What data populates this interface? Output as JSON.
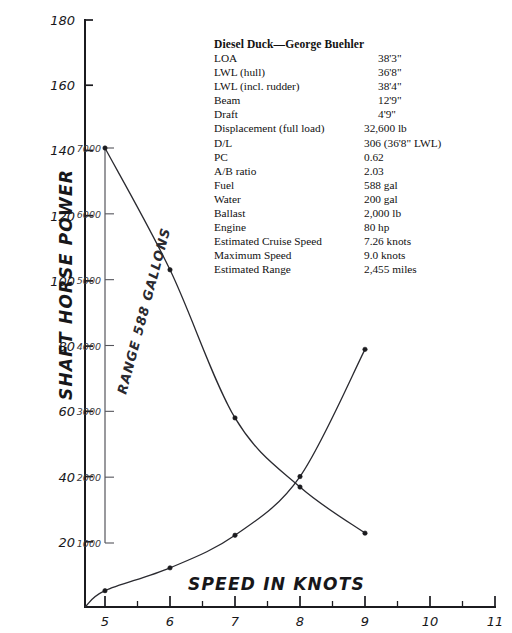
{
  "spec": {
    "title": "Diesel Duck—George Buehler",
    "rows": [
      {
        "label": "LOA",
        "value": "38'3\"",
        "indent": true
      },
      {
        "label": "LWL (hull)",
        "value": "36'8\"",
        "indent": true
      },
      {
        "label": "LWL (incl. rudder)",
        "value": "38'4\"",
        "indent": true
      },
      {
        "label": "Beam",
        "value": "12'9\"",
        "indent": true
      },
      {
        "label": "Draft",
        "value": "4'9\"",
        "indent": true
      },
      {
        "label": "Displacement (full load)",
        "value": "32,600 lb",
        "indent": false
      },
      {
        "label": "D/L",
        "value": "306 (36'8\" LWL)",
        "indent": false
      },
      {
        "label": "PC",
        "value": "0.62",
        "indent": false
      },
      {
        "label": "A/B ratio",
        "value": "2.03",
        "indent": false
      },
      {
        "label": "Fuel",
        "value": "588 gal",
        "indent": false
      },
      {
        "label": "Water",
        "value": "200 gal",
        "indent": false
      },
      {
        "label": "Ballast",
        "value": "2,000 lb",
        "indent": false
      },
      {
        "label": "Engine",
        "value": "80 hp",
        "indent": false
      },
      {
        "label": "Estimated Cruise Speed",
        "value": "7.26 knots",
        "indent": false
      },
      {
        "label": "Maximum Speed",
        "value": "9.0 knots",
        "indent": false
      },
      {
        "label": "Estimated Range",
        "value": "2,455 miles",
        "indent": false
      }
    ]
  },
  "chart_data": {
    "type": "line",
    "title": "",
    "xlabel": "SPEED IN KNOTS",
    "ylabel": "SHAFT HORSE POWER",
    "y2label": "RANGE 588 GALLONS",
    "grid": false,
    "legend": "none",
    "xlim": [
      4,
      11
    ],
    "ylim": [
      0,
      180
    ],
    "y2lim": [
      0,
      7000
    ],
    "xticks": [
      5,
      6,
      7,
      8,
      9,
      10,
      11
    ],
    "xtick_labels": [
      "5",
      "6",
      "7",
      "8",
      "9",
      "10",
      "11"
    ],
    "xminor_ticks": [
      4.5,
      5.5,
      6.5,
      7.5,
      8.5,
      9.5,
      10.5
    ],
    "yticks": [
      20,
      40,
      60,
      80,
      100,
      120,
      140,
      160,
      180
    ],
    "ytick_labels": [
      "20",
      "40",
      "60",
      "80",
      "100",
      "120",
      "140",
      "160",
      "180"
    ],
    "y2ticks": [
      1000,
      2000,
      3000,
      4000,
      5000,
      6000,
      7000
    ],
    "y2tick_labels": [
      "1000",
      "2000",
      "3000",
      "4000",
      "5000",
      "6000",
      "7000"
    ],
    "series": [
      {
        "name": "Shaft Horse Power",
        "axis": "left",
        "units": "hp",
        "x": [
          5,
          6,
          7,
          8,
          9
        ],
        "values": [
          5,
          12,
          22,
          40,
          79
        ]
      },
      {
        "name": "Range 588 Gallons",
        "axis": "right",
        "units": "miles",
        "x": [
          5,
          6,
          7,
          8,
          9
        ],
        "values": [
          7000,
          5150,
          2900,
          1850,
          1150
        ]
      }
    ],
    "annotations": [
      {
        "text": "curves cross near 7.7 knots"
      }
    ]
  }
}
